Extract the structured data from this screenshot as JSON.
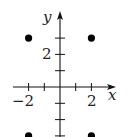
{
  "chart_data": {
    "type": "scatter",
    "title": "",
    "xlabel": "x",
    "ylabel": "y",
    "xlim": [
      -3,
      3.4
    ],
    "ylim": [
      -3,
      4.6
    ],
    "grid": false,
    "legend": null,
    "x_tick_positions": [
      -2,
      -1,
      1,
      2
    ],
    "y_tick_positions": [
      -3,
      -2,
      -1,
      1,
      2,
      3
    ],
    "x_tick_labels": [
      {
        "value": -2,
        "label": "−2"
      },
      {
        "value": 2,
        "label": "2"
      }
    ],
    "y_tick_labels": [
      {
        "value": 2,
        "label": "2"
      }
    ],
    "series": [
      {
        "name": "points",
        "color": "#000000",
        "points": [
          {
            "x": -2,
            "y": 3
          },
          {
            "x": 2,
            "y": 3
          },
          {
            "x": -2,
            "y": -3
          },
          {
            "x": 2,
            "y": -3
          }
        ]
      }
    ]
  },
  "labels": {
    "x_axis": "x",
    "y_axis": "y",
    "x_neg2": "−2",
    "x_pos2": "2",
    "y_pos2": "2"
  },
  "colors": {
    "axis": "#111111",
    "points": "#000000",
    "text": "#222222",
    "background": "#ffffff"
  }
}
